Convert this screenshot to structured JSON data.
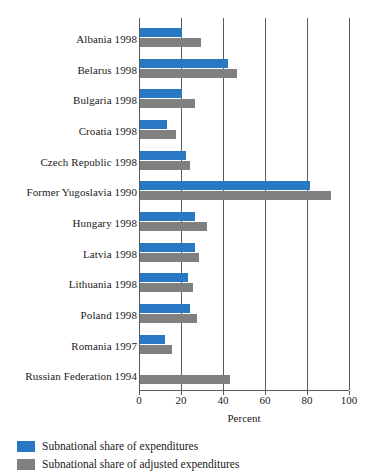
{
  "chart_data": {
    "type": "bar",
    "orientation": "horizontal",
    "title": "",
    "xlabel": "Percent",
    "ylabel": "",
    "xlim": [
      0,
      100
    ],
    "xticks": [
      0,
      20,
      40,
      60,
      80,
      100
    ],
    "xtick_labels": [
      "0",
      "20",
      "40",
      "60",
      "80",
      "100"
    ],
    "grid": true,
    "grid_axis": "x",
    "legend_position": "below",
    "categories": [
      "Albania 1998",
      "Belarus 1998",
      "Bulgaria 1998",
      "Croatia 1998",
      "Czech Republic 1998",
      "Former Yugoslavia 1990",
      "Hungary 1998",
      "Latvia 1998",
      "Lithuania 1998",
      "Poland 1998",
      "Romania 1997",
      "Russian Federation 1994"
    ],
    "series": [
      {
        "name": "Subnational share of expenditures",
        "color": "#2878c4",
        "values": [
          20,
          42,
          20,
          13,
          22,
          81,
          26,
          26,
          23,
          24,
          12,
          0
        ]
      },
      {
        "name": "Subnational share of adjusted expenditures",
        "color": "#808080",
        "values": [
          29,
          46,
          26,
          17,
          24,
          91,
          32,
          28,
          25,
          27,
          15,
          43
        ]
      }
    ]
  },
  "axis": {
    "x_title": "Percent"
  },
  "legend": {
    "entries": [
      {
        "label": "Subnational share of expenditures",
        "color": "#2878c4"
      },
      {
        "label": "Subnational share of adjusted expenditures",
        "color": "#808080"
      }
    ]
  },
  "colors": {
    "series_a": "#2878c4",
    "series_b": "#808080",
    "axis": "#5a5a5a",
    "text": "#1a1a1a",
    "background": "#ffffff"
  }
}
